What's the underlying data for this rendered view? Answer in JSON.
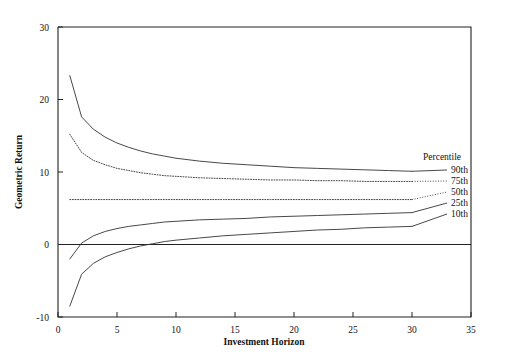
{
  "chart_data": {
    "type": "line",
    "title": "",
    "subtitle": "",
    "xlabel": "Investment Horizon",
    "ylabel": "Geometric Return",
    "xlim": [
      0,
      35
    ],
    "ylim": [
      -10,
      30
    ],
    "xticks": [
      0,
      5,
      10,
      15,
      20,
      25,
      30,
      35
    ],
    "xtick_labels": [
      "0",
      "5",
      "10",
      "15",
      "20",
      "25",
      "30",
      "35"
    ],
    "yticks": [
      -10,
      0,
      10,
      20,
      30
    ],
    "ytick_labels": [
      "-10",
      "0",
      "10",
      "20",
      "30"
    ],
    "grid": false,
    "legend_position": "right",
    "legend_title": "Percentile",
    "zero_reference_line": 0,
    "x": [
      1,
      2,
      3,
      4,
      5,
      6,
      7,
      8,
      9,
      10,
      12,
      14,
      16,
      18,
      20,
      22,
      24,
      26,
      28,
      30
    ],
    "series": [
      {
        "name": "90th",
        "style": "solid",
        "color": "#333333",
        "values": [
          23.3,
          17.6,
          15.9,
          14.8,
          14.0,
          13.4,
          12.9,
          12.5,
          12.2,
          11.9,
          11.5,
          11.2,
          11.0,
          10.8,
          10.6,
          10.5,
          10.4,
          10.3,
          10.2,
          10.1
        ]
      },
      {
        "name": "75th",
        "style": "dotted",
        "color": "#333333",
        "values": [
          15.2,
          12.7,
          11.6,
          11.0,
          10.5,
          10.2,
          9.9,
          9.7,
          9.5,
          9.4,
          9.2,
          9.1,
          9.0,
          8.9,
          8.9,
          8.8,
          8.8,
          8.7,
          8.7,
          8.7
        ]
      },
      {
        "name": "50th",
        "style": "dotted",
        "color": "#333333",
        "values": [
          6.2,
          6.2,
          6.2,
          6.2,
          6.2,
          6.2,
          6.2,
          6.2,
          6.2,
          6.2,
          6.2,
          6.2,
          6.2,
          6.2,
          6.2,
          6.2,
          6.2,
          6.2,
          6.2,
          6.2
        ]
      },
      {
        "name": "25th",
        "style": "solid",
        "color": "#333333",
        "values": [
          -2.0,
          0.2,
          1.2,
          1.8,
          2.2,
          2.5,
          2.7,
          2.9,
          3.1,
          3.2,
          3.4,
          3.5,
          3.6,
          3.8,
          3.9,
          4.0,
          4.1,
          4.2,
          4.3,
          4.4
        ]
      },
      {
        "name": "10th",
        "style": "solid",
        "color": "#333333",
        "values": [
          -8.5,
          -4.1,
          -2.6,
          -1.7,
          -1.1,
          -0.6,
          -0.2,
          0.1,
          0.4,
          0.6,
          0.9,
          1.2,
          1.4,
          1.6,
          1.8,
          2.0,
          2.1,
          2.3,
          2.4,
          2.5
        ]
      }
    ]
  },
  "axes": {
    "x_label": "Investment Horizon",
    "y_label": "Geometric Return",
    "x_ticks": [
      "0",
      "5",
      "10",
      "15",
      "20",
      "25",
      "30",
      "35"
    ],
    "y_ticks": [
      "30",
      "20",
      "10",
      "0",
      "-10"
    ]
  },
  "legend": {
    "title": "Percentile",
    "entries": [
      {
        "label": "90th"
      },
      {
        "label": "75th"
      },
      {
        "label": "50th"
      },
      {
        "label": "25th"
      },
      {
        "label": "10th"
      }
    ]
  },
  "colors": {
    "line": "#333333",
    "frame": "#222222",
    "background": "#ffffff"
  }
}
